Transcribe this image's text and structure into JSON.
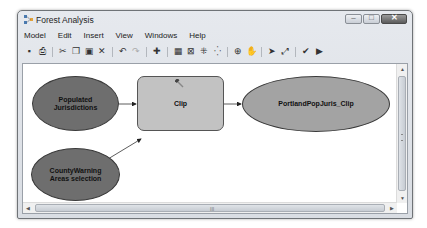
{
  "window": {
    "title": "Forest Analysis",
    "controls": {
      "minimize": "–",
      "maximize": "□",
      "close": "✕"
    }
  },
  "menubar": {
    "items": [
      "Model",
      "Edit",
      "Insert",
      "View",
      "Windows",
      "Help"
    ]
  },
  "toolbar": {
    "icons": {
      "save": "▪",
      "print": "⎙",
      "cut": "✂",
      "copy": "❐",
      "paste": "▣",
      "delete": "✕",
      "undo": "↶",
      "redo": "↷",
      "add_data": "✚",
      "auto_layout": "▦",
      "full_extent": "⊠",
      "zoom_in_fixed": "⁜",
      "zoom_out_fixed": "⁛",
      "zoom_in": "⊕",
      "pan": "✋",
      "select": "➤",
      "connect": "⤢",
      "validate": "✔",
      "run": "▶"
    }
  },
  "model": {
    "nodes": [
      {
        "id": "populated",
        "type": "input",
        "label_line1": "Populated",
        "label_line2": "Jurisdictions"
      },
      {
        "id": "clip",
        "type": "tool",
        "label": "Clip"
      },
      {
        "id": "output",
        "type": "output",
        "label": "PortlandPopJuris_Clip"
      },
      {
        "id": "county",
        "type": "input",
        "label_line1": "CountyWarning",
        "label_line2": "Areas selection"
      }
    ],
    "colors": {
      "input": "#6e6e6e",
      "tool": "#c2c2c2",
      "output": "#a3a3a3"
    }
  },
  "scrollbars": {
    "up": "▲",
    "down": "▼",
    "left": "◀",
    "right": "▶",
    "hgrip": "III"
  }
}
